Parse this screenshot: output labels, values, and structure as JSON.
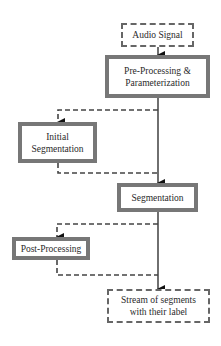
{
  "diagram": {
    "nodes": [
      {
        "id": "audio",
        "label": "Audio Signal",
        "style": "dashed"
      },
      {
        "id": "preproc",
        "label": "Pre-Processing & Parameterization",
        "line1": "Pre-Processing &",
        "line2": "Parameterization",
        "style": "solid"
      },
      {
        "id": "initseg",
        "label": "Initial Segmentation",
        "line1": "Initial",
        "line2": "Segmentation",
        "style": "solid"
      },
      {
        "id": "seg",
        "label": "Segmentation",
        "style": "solid"
      },
      {
        "id": "postproc",
        "label": "Post-Processing",
        "style": "solid"
      },
      {
        "id": "stream",
        "label": "Stream of segments with their label",
        "line1": "Stream of segments",
        "line2": "with their label",
        "style": "dashed"
      }
    ],
    "edges": [
      {
        "from": "audio",
        "to": "preproc",
        "style": "solid"
      },
      {
        "from": "preproc",
        "to": "seg",
        "style": "solid"
      },
      {
        "from": "preproc",
        "to": "initseg",
        "style": "dashed"
      },
      {
        "from": "initseg",
        "to": "seg",
        "style": "dashed"
      },
      {
        "from": "seg",
        "to": "stream",
        "style": "solid"
      },
      {
        "from": "seg",
        "to": "postproc",
        "style": "dashed"
      },
      {
        "from": "postproc",
        "to": "stream",
        "style": "dashed"
      }
    ],
    "colors": {
      "solid_border": "#777777",
      "dashed_border": "#666666",
      "line": "#222222"
    }
  }
}
